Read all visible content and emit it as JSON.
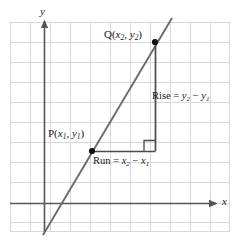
{
  "figure": {
    "axes": {
      "x_label": "x",
      "y_label": "y"
    },
    "points": [
      {
        "name": "P",
        "label_prefix": "P(",
        "x_var": "x",
        "x_sub": "1",
        "sep": ", ",
        "y_var": "y",
        "y_sub": "1",
        "label_suffix": ")"
      },
      {
        "name": "Q",
        "label_prefix": "Q(",
        "x_var": "x",
        "x_sub": "2",
        "sep": ", ",
        "y_var": "y",
        "y_sub": "2",
        "label_suffix": ")"
      }
    ],
    "annotations": {
      "rise_prefix": "Rise = ",
      "rise_term1_var": "y",
      "rise_term1_sub": "2",
      "rise_minus": " − ",
      "rise_term2_var": "y",
      "rise_term2_sub": "1",
      "run_prefix": "Run = ",
      "run_term1_var": "x",
      "run_term1_sub": "2",
      "run_minus": " − ",
      "run_term2_var": "x",
      "run_term2_sub": "1"
    },
    "colors": {
      "grid": "#d8d8d8",
      "axis": "#555555",
      "line": "#6b6b6b",
      "leg": "#4a4a4a",
      "point": "#111111",
      "text": "#1a1a1a",
      "background": "#ffffff"
    },
    "geometry": {
      "grid_left": 10,
      "grid_top": 22,
      "grid_right": 230,
      "grid_bottom": 232,
      "grid_step": 20,
      "x_axis_y": 203,
      "y_axis_x": 44,
      "p_x": 92,
      "p_y": 151,
      "q_x": 155,
      "q_y": 42,
      "corner_x": 155,
      "corner_y": 151,
      "line_x1": 43,
      "line_y1": 235,
      "line_x2": 172,
      "line_y2": 18
    }
  }
}
